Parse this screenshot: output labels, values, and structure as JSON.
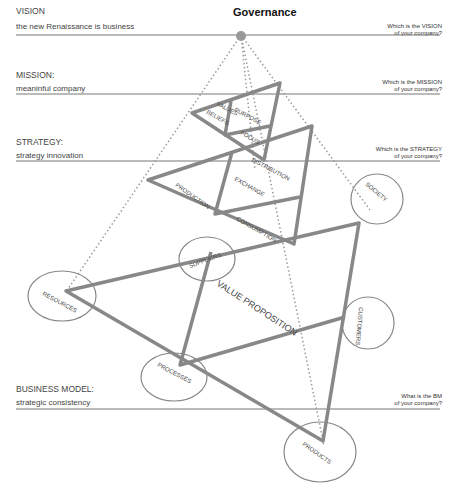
{
  "title": "Governance",
  "levels": [
    {
      "id": "vision",
      "title": "VISION",
      "subtitle": "the new Renaissance is business",
      "question_line1": "Which is the VISION",
      "question_line2": "of your company?"
    },
    {
      "id": "mission",
      "title": "MISSION:",
      "subtitle": "meaninful company",
      "question_line1": "Which is the MISSION",
      "question_line2": "of your company?"
    },
    {
      "id": "strategy",
      "title": "STRATEGY:",
      "subtitle": "strategy innovation",
      "question_line1": "Which is the STRATEGY",
      "question_line2": "of your company?"
    },
    {
      "id": "business_model",
      "title": "BUSINESS MODEL:",
      "subtitle": "strategic consistency",
      "question_line1": "What is the BM",
      "question_line2": "of your company?"
    }
  ],
  "mission_triangle": {
    "values": "VALUES",
    "beliefs": "BELIEFS",
    "purpose": "PURPOSE",
    "focus": "FOCUS"
  },
  "strategy_triangle": {
    "distribution": "DISTRIBUTION",
    "production": "PRODUCTION",
    "exchange": "EXCHANGE",
    "consumption": "CONSUMPTION"
  },
  "bm_triangle": {
    "value_proposition": "VALUE PROPOSITION"
  },
  "circles": {
    "society": "SOCIETY",
    "suppliers": "SUPPLIERS",
    "resources": "RESOURCES",
    "processes": "PROCESSES",
    "customers": "CUSTOMERS",
    "products": "PRODUCTS"
  },
  "colors": {
    "line": "#888888",
    "text": "#444444",
    "apex": "#999999"
  }
}
